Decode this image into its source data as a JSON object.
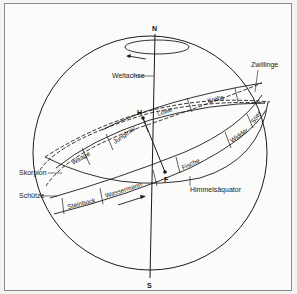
{
  "diagram": {
    "poles": {
      "north": "N",
      "south": "S"
    },
    "points": {
      "h": "H",
      "f": "F"
    },
    "labels": {
      "axis": "Weltachse",
      "equator": "Himmelsäquator",
      "zwillinge": "Zwillinge",
      "skorpion": "Skorpion",
      "schuetze": "Schütze"
    },
    "zodiac_band": [
      {
        "name": "Steinbock"
      },
      {
        "name": "Wassermann"
      },
      {
        "name": "Fische"
      },
      {
        "name": "Widder"
      },
      {
        "name": "Stier"
      },
      {
        "name": "Zwillinge"
      },
      {
        "name": "Krebs"
      },
      {
        "name": "Löwe"
      },
      {
        "name": "Jungfrau"
      },
      {
        "name": "Waage"
      },
      {
        "name": "Skorpion"
      },
      {
        "name": "Schütze"
      }
    ],
    "colors": {
      "line": "#1a1a1a",
      "background": "#fbfbf9",
      "border": "#8a8a8a"
    }
  }
}
